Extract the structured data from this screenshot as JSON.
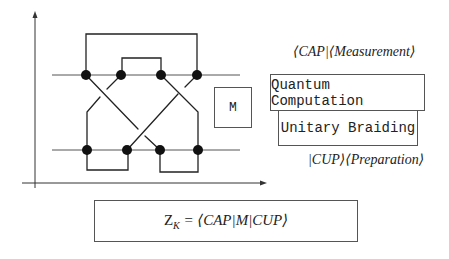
{
  "diagram": {
    "colors": {
      "stroke": "#222222",
      "box_border": "#555555",
      "background": "#ffffff"
    },
    "knot": {
      "upper_line_y": 75,
      "lower_line_y": 150,
      "upper_nodes_x": [
        86,
        121,
        161,
        197
      ],
      "lower_nodes_x": [
        87,
        127,
        160,
        198
      ]
    },
    "m_box": {
      "label": "M"
    },
    "labels": {
      "cap_measurement": "⟨CAP|⟨Measurement⟩",
      "quantum_computation": "Quantum Computation",
      "unitary_braiding": "Unitary Braiding",
      "cup_preparation": "|CUP⟩⟨Preparation⟩"
    },
    "formula": {
      "lhs_main": "Z",
      "lhs_sub": "K",
      "rhs": " = ⟨CAP|M|CUP⟩"
    }
  }
}
